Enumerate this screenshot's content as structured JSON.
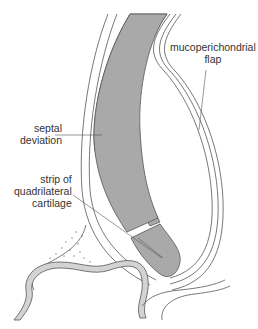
{
  "diagram": {
    "colors": {
      "background": "#ffffff",
      "outline": "#555555",
      "cartilage_fill": "#a9a9a9",
      "bone_fill": "#d3d3d3",
      "leader_line": "#555555",
      "label_text": "#333333"
    },
    "labels": {
      "flap": {
        "line1": "mucoperichondrial",
        "line2": "flap"
      },
      "deviation": {
        "line1": "septal",
        "line2": "deviation"
      },
      "strip": {
        "line1": "strip of",
        "line2": "quadrilateral",
        "line3": "cartilage"
      }
    }
  }
}
